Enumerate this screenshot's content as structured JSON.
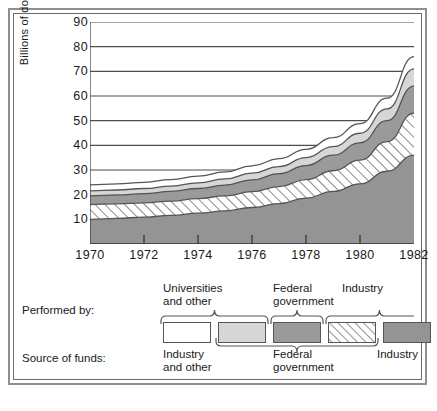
{
  "chart_data": {
    "type": "area",
    "title": "",
    "xlabel": "",
    "ylabel": "Billions of dollars",
    "x": [
      1970,
      1971,
      1972,
      1973,
      1974,
      1975,
      1976,
      1977,
      1978,
      1979,
      1980,
      1981,
      1982
    ],
    "xlim": [
      1970,
      1982
    ],
    "ylim": [
      0,
      90
    ],
    "ytick_labels": [
      "10",
      "20",
      "30",
      "40",
      "50",
      "60",
      "70",
      "80",
      "90"
    ],
    "ytick_values": [
      10,
      20,
      30,
      40,
      50,
      60,
      70,
      80,
      90
    ],
    "xtick_labels": [
      "1970",
      "1972",
      "1974",
      "1976",
      "1978",
      "1980",
      "1982"
    ],
    "xtick_values": [
      1970,
      1972,
      1974,
      1976,
      1978,
      1980,
      1982
    ],
    "grid": true,
    "stacked": true,
    "legend_position": "below",
    "series": [
      {
        "name": "Industry performed / Industry funded",
        "performed_by": "Industry",
        "source_of_funds": "Industry",
        "fill": "dark-gray",
        "color": "#949494",
        "values": [
          10.0,
          10.4,
          10.9,
          11.6,
          12.5,
          13.4,
          14.8,
          16.4,
          18.6,
          21.3,
          24.4,
          29.5,
          36.0
        ],
        "cumulative_top": [
          10.0,
          10.4,
          10.9,
          11.6,
          12.5,
          13.4,
          14.8,
          16.4,
          18.6,
          21.3,
          24.4,
          29.5,
          36.0
        ]
      },
      {
        "name": "Industry performed / Federal funded",
        "performed_by": "Industry",
        "source_of_funds": "Federal government",
        "fill": "hatched",
        "color": "#ffffff",
        "values": [
          6.0,
          5.9,
          5.8,
          5.8,
          5.9,
          6.1,
          6.4,
          6.9,
          7.5,
          8.4,
          9.6,
          12.0,
          17.0
        ],
        "cumulative_top": [
          16.0,
          16.3,
          16.7,
          17.4,
          18.4,
          19.5,
          21.2,
          23.3,
          26.1,
          29.7,
          34.0,
          41.5,
          53.0
        ]
      },
      {
        "name": "Federal government performed / Federal funded",
        "performed_by": "Federal government",
        "source_of_funds": "Federal government",
        "fill": "mid-gray",
        "color": "#9a9a9a",
        "values": [
          3.5,
          3.6,
          3.7,
          3.9,
          4.1,
          4.4,
          4.8,
          5.2,
          5.7,
          6.3,
          7.0,
          8.5,
          11.0
        ],
        "cumulative_top": [
          19.5,
          19.9,
          20.4,
          21.3,
          22.5,
          23.9,
          26.0,
          28.5,
          31.8,
          36.0,
          41.0,
          50.0,
          64.0
        ]
      },
      {
        "name": "Universities and other performed / Federal funded",
        "performed_by": "Universities and other",
        "source_of_funds": "Federal government",
        "fill": "light-gray",
        "color": "#d6d6d6",
        "values": [
          2.0,
          2.0,
          2.1,
          2.2,
          2.3,
          2.5,
          2.7,
          2.9,
          3.2,
          3.5,
          3.9,
          4.8,
          7.0
        ],
        "cumulative_top": [
          21.5,
          21.9,
          22.5,
          23.5,
          24.8,
          26.4,
          28.7,
          31.4,
          35.0,
          39.5,
          44.9,
          54.8,
          71.0
        ]
      },
      {
        "name": "Universities and other performed / Industry and other funded",
        "performed_by": "Universities and other",
        "source_of_funds": "Industry and other",
        "fill": "white",
        "color": "#ffffff",
        "values": [
          2.5,
          2.5,
          2.5,
          2.6,
          2.7,
          2.8,
          3.0,
          3.2,
          3.4,
          3.6,
          3.9,
          4.3,
          5.0
        ],
        "cumulative_top": [
          24.0,
          24.4,
          25.0,
          26.1,
          27.5,
          29.2,
          31.7,
          34.6,
          38.4,
          43.1,
          48.8,
          59.1,
          76.0
        ]
      }
    ]
  },
  "legend": {
    "performed_by_label": "Performed by:",
    "source_of_funds_label": "Source of funds:",
    "performed_groups": [
      {
        "line1": "Universities",
        "line2": "and other"
      },
      {
        "line1": "Federal",
        "line2": "government"
      },
      {
        "line1": "Industry",
        "line2": ""
      }
    ],
    "source_groups": [
      {
        "line1": "Industry",
        "line2": "and other"
      },
      {
        "line1": "Federal",
        "line2": "government"
      },
      {
        "line1": "Industry",
        "line2": ""
      }
    ],
    "swatches": [
      {
        "name": "universities-industry-funded",
        "fill": "white"
      },
      {
        "name": "universities-federal-funded",
        "fill": "light-gray"
      },
      {
        "name": "federal-performed-federal-funded",
        "fill": "mid-gray"
      },
      {
        "name": "industry-performed-federal-funded",
        "fill": "hatched"
      },
      {
        "name": "industry-performed-industry-funded",
        "fill": "dark-gray"
      }
    ]
  },
  "colors": {
    "dark_gray": "#949494",
    "mid_gray": "#9a9a9a",
    "light_gray": "#d6d6d6",
    "white": "#ffffff",
    "line": "#555555",
    "text": "#1a1a1a",
    "frame_outer": "#8f8f8f",
    "frame_inner": "#6b6b6b"
  }
}
